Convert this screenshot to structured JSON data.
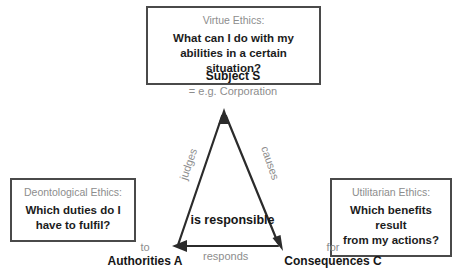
{
  "diagram": {
    "colors": {
      "line": "#2b2b2b",
      "box_border": "#4a4a4a",
      "muted_text": "#8d8d8d",
      "strong_text": "#161616",
      "background": "#ffffff"
    }
  },
  "boxes": {
    "virtue": {
      "heading": "Virtue Ethics:",
      "question_line1": "What can I do with my",
      "question_line2": "abilities in a certain situation?"
    },
    "deontological": {
      "heading": "Deontological Ethics:",
      "question_line1": "Which duties do I",
      "question_line2": "have to fulfil?"
    },
    "utilitarian": {
      "heading": "Utilitarian Ethics:",
      "question_line1": "Which benefits result",
      "question_line2": "from my actions?"
    }
  },
  "nodes": {
    "subject": {
      "title": "Subject S",
      "subtitle": "= e.g. Corporation"
    },
    "authorities": {
      "preposition": "to",
      "title": "Authorities A"
    },
    "consequences": {
      "preposition": "for",
      "title": "Consequences C"
    }
  },
  "edges": {
    "judges": "judges",
    "causes": "causes",
    "responds": "responds",
    "is_responsible": "is responsible"
  },
  "icons": {
    "arrow_up": "arrow-up-icon",
    "arrow_left": "arrow-left-icon",
    "arrow_down_right": "arrow-down-right-icon"
  }
}
